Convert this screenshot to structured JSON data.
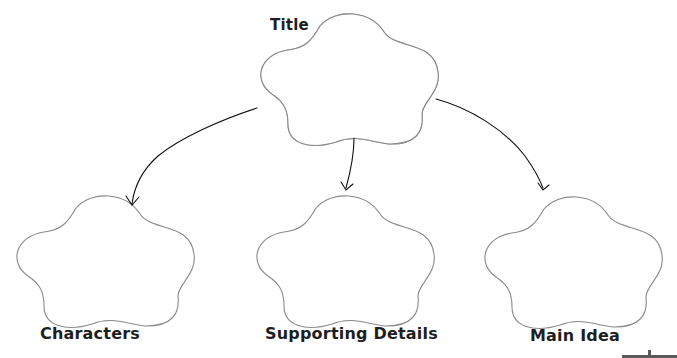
{
  "diagram": {
    "type": "story-map graphic organizer",
    "nodes": [
      {
        "id": "title",
        "label": "Title",
        "content": ""
      },
      {
        "id": "characters",
        "label": "Characters",
        "content": ""
      },
      {
        "id": "supporting_details",
        "label": "Supporting Details",
        "content": ""
      },
      {
        "id": "main_idea",
        "label": "Main Idea",
        "content": ""
      }
    ],
    "edges": [
      {
        "from": "title",
        "to": "characters"
      },
      {
        "from": "title",
        "to": "supporting_details"
      },
      {
        "from": "title",
        "to": "main_idea"
      }
    ],
    "colors": {
      "bubble_stroke": "#8a8a8a",
      "arrow": "#111111",
      "label": "#1e1e1e",
      "background": "#ffffff"
    }
  }
}
